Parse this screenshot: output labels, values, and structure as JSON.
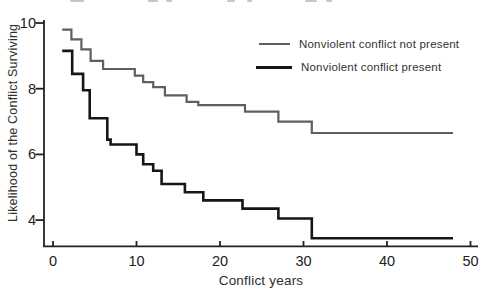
{
  "figure": {
    "xlabel": "Conflict years",
    "ylabel": "Likelihood of the Conflict Surviving"
  },
  "legend": {
    "items": [
      {
        "label": "Nonviolent conflict not present",
        "color": "#5f5f5f"
      },
      {
        "label": "Nonviolent conflict present",
        "color": "#161616"
      }
    ]
  },
  "chart_data": {
    "type": "line",
    "subtype": "step_survival_curve",
    "title": "",
    "xlabel": "Conflict years",
    "ylabel": "Likelihood of the Conflict Surviving",
    "xlim": [
      0,
      50
    ],
    "ylim": [
      3.2,
      10
    ],
    "x_ticks": [
      0,
      10,
      20,
      30,
      40,
      50
    ],
    "y_ticks": [
      10,
      8,
      6,
      4
    ],
    "grid": false,
    "legend_position": "upper-right",
    "axis_color": "#222222",
    "series": [
      {
        "name": "Nonviolent conflict not present",
        "color": "#5f5f5f",
        "stroke_width": 2.2,
        "start": [
          1.1,
          9.8
        ],
        "steps": [
          [
            2.2,
            9.5
          ],
          [
            3.4,
            9.2
          ],
          [
            4.5,
            8.85
          ],
          [
            6,
            8.6
          ],
          [
            9.8,
            8.4
          ],
          [
            10.8,
            8.2
          ],
          [
            12,
            8.05
          ],
          [
            13.4,
            7.8
          ],
          [
            16,
            7.6
          ],
          [
            17.4,
            7.5
          ],
          [
            23,
            7.3
          ],
          [
            27,
            7.0
          ],
          [
            31,
            6.65
          ]
        ],
        "end_x": 47.9
      },
      {
        "name": "Nonviolent conflict present",
        "color": "#161616",
        "stroke_width": 2.6,
        "start": [
          1.1,
          9.15
        ],
        "steps": [
          [
            2.3,
            8.45
          ],
          [
            3.6,
            7.95
          ],
          [
            4.4,
            7.1
          ],
          [
            6.5,
            6.45
          ],
          [
            6.9,
            6.3
          ],
          [
            10,
            6.0
          ],
          [
            10.8,
            5.7
          ],
          [
            12,
            5.5
          ],
          [
            13,
            5.1
          ],
          [
            15.8,
            4.85
          ],
          [
            18,
            4.6
          ],
          [
            22.7,
            4.35
          ],
          [
            27,
            4.05
          ],
          [
            31,
            3.45
          ]
        ],
        "end_x": 47.9
      }
    ]
  }
}
